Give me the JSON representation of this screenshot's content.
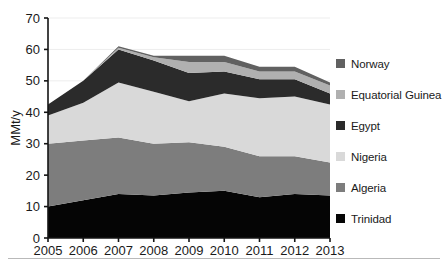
{
  "chart_data": {
    "type": "area",
    "stacked": true,
    "title": "",
    "xlabel": "",
    "ylabel": "MMt/y",
    "categories": [
      "2005",
      "2006",
      "2007",
      "2008",
      "2009",
      "2010",
      "2011",
      "2012",
      "2013"
    ],
    "x": [
      2005,
      2006,
      2007,
      2008,
      2009,
      2010,
      2011,
      2012,
      2013
    ],
    "ylim": [
      0,
      70
    ],
    "yticks": [
      0,
      10,
      20,
      30,
      40,
      50,
      60,
      70
    ],
    "ytick_labels": [
      "0",
      "10",
      "20",
      "30",
      "40",
      "50",
      "60",
      "70"
    ],
    "grid": true,
    "legend_position": "right",
    "series": [
      {
        "name": "Trinidad",
        "color": "#050505",
        "values": [
          10.0,
          12.0,
          14.0,
          13.5,
          14.5,
          15.0,
          13.0,
          14.0,
          13.5
        ]
      },
      {
        "name": "Algeria",
        "color": "#7d7d7d",
        "values": [
          20.0,
          19.0,
          18.0,
          16.5,
          16.0,
          14.0,
          13.0,
          12.0,
          10.5
        ]
      },
      {
        "name": "Nigeria",
        "color": "#d9d9d9",
        "values": [
          9.0,
          12.0,
          17.5,
          16.5,
          13.0,
          17.0,
          18.5,
          19.0,
          18.5
        ]
      },
      {
        "name": "Egypt",
        "color": "#2b2b2b",
        "values": [
          3.5,
          7.0,
          10.5,
          10.0,
          9.0,
          7.0,
          6.0,
          5.5,
          3.5
        ]
      },
      {
        "name": "Equatorial Guinea",
        "color": "#b0b0b0",
        "values": [
          0.0,
          0.0,
          0.5,
          1.0,
          3.5,
          3.0,
          2.5,
          2.5,
          2.5
        ]
      },
      {
        "name": "Norway",
        "color": "#616161",
        "values": [
          0.0,
          0.0,
          0.5,
          0.5,
          2.0,
          2.0,
          1.5,
          1.5,
          1.0
        ]
      }
    ],
    "cumulative_tops": {
      "Trinidad": [
        10.0,
        12.0,
        14.0,
        13.5,
        14.5,
        15.0,
        13.0,
        14.0,
        13.5
      ],
      "Algeria": [
        30.0,
        31.0,
        32.0,
        30.0,
        30.5,
        29.0,
        26.0,
        26.0,
        24.0
      ],
      "Nigeria": [
        39.0,
        43.0,
        49.5,
        46.5,
        43.5,
        46.0,
        44.5,
        45.0,
        42.5
      ],
      "Egypt": [
        42.5,
        50.0,
        60.0,
        56.5,
        52.5,
        53.0,
        50.5,
        50.5,
        46.0
      ],
      "Equatorial Guinea": [
        42.5,
        50.0,
        60.5,
        57.5,
        56.0,
        56.0,
        53.0,
        53.0,
        48.5
      ],
      "Norway": [
        42.5,
        50.0,
        61.0,
        58.0,
        58.0,
        58.0,
        54.5,
        54.5,
        49.5
      ]
    }
  },
  "legend": {
    "items": [
      {
        "label": "Norway",
        "color": "#616161"
      },
      {
        "label": "Equatorial Guinea",
        "color": "#b0b0b0"
      },
      {
        "label": "Egypt",
        "color": "#2b2b2b"
      },
      {
        "label": "Nigeria",
        "color": "#d9d9d9"
      },
      {
        "label": "Algeria",
        "color": "#7d7d7d"
      },
      {
        "label": "Trinidad",
        "color": "#050505"
      }
    ]
  },
  "axes": {
    "y_axis_label": "MMt/y",
    "y_ticks": [
      "0",
      "10",
      "20",
      "30",
      "40",
      "50",
      "60",
      "70"
    ],
    "x_ticks": [
      "2005",
      "2006",
      "2007",
      "2008",
      "2009",
      "2010",
      "2011",
      "2012",
      "2013"
    ]
  }
}
